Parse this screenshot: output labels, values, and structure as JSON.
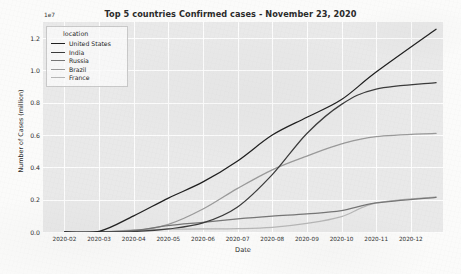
{
  "chart_data": {
    "type": "line",
    "title": "Top 5 countries Confirmed cases - November 23, 2020",
    "xlabel": "Date",
    "ylabel": "Number of Cases (million)",
    "y_exponent_label": "1e7",
    "grid": true,
    "legend_position": "upper left",
    "legend_title": "location",
    "x_tick_labels": [
      "2020-02",
      "2020-03",
      "2020-04",
      "2020-05",
      "2020-06",
      "2020-07",
      "2020-08",
      "2020-09",
      "2020-10",
      "2020-11",
      "2020-12"
    ],
    "y_tick_labels": [
      "0.0",
      "0.2",
      "0.4",
      "0.6",
      "0.8",
      "1.0",
      "1.2"
    ],
    "y_tick_values": [
      0.0,
      0.2,
      0.4,
      0.6,
      0.8,
      1.0,
      1.2
    ],
    "xlim": [
      "2020-01-22",
      "2020-12-05"
    ],
    "ylim": [
      0.0,
      1.3
    ],
    "y_units": "1e7 cases",
    "series": [
      {
        "name": "United States",
        "color": "#1f1f1f",
        "x": [
          "2020-02",
          "2020-03",
          "2020-04",
          "2020-05",
          "2020-06",
          "2020-07",
          "2020-08",
          "2020-09",
          "2020-10",
          "2020-11",
          "2020-11-23"
        ],
        "values": [
          0.0,
          0.004,
          0.1,
          0.21,
          0.31,
          0.44,
          0.6,
          0.71,
          0.82,
          0.99,
          1.255
        ]
      },
      {
        "name": "India",
        "color": "#3b3b3b",
        "x": [
          "2020-02",
          "2020-03",
          "2020-04",
          "2020-05",
          "2020-06",
          "2020-07",
          "2020-08",
          "2020-09",
          "2020-10",
          "2020-11",
          "2020-11-23"
        ],
        "values": [
          0.0,
          0.0001,
          0.003,
          0.019,
          0.056,
          0.155,
          0.355,
          0.61,
          0.79,
          0.885,
          0.925
        ]
      },
      {
        "name": "Russia",
        "color": "#767676",
        "x": [
          "2020-02",
          "2020-03",
          "2020-04",
          "2020-05",
          "2020-06",
          "2020-07",
          "2020-08",
          "2020-09",
          "2020-10",
          "2020-11",
          "2020-11-23"
        ],
        "values": [
          0.0,
          0.0002,
          0.01,
          0.04,
          0.06,
          0.081,
          0.098,
          0.112,
          0.132,
          0.18,
          0.215
        ]
      },
      {
        "name": "Brazil",
        "color": "#9a9a9a",
        "x": [
          "2020-02",
          "2020-03",
          "2020-04",
          "2020-05",
          "2020-06",
          "2020-07",
          "2020-08",
          "2020-09",
          "2020-10",
          "2020-11",
          "2020-11-23"
        ],
        "values": [
          0.0,
          0.0001,
          0.007,
          0.047,
          0.142,
          0.27,
          0.385,
          0.47,
          0.545,
          0.59,
          0.61
        ]
      },
      {
        "name": "France",
        "color": "#b6b6b6",
        "x": [
          "2020-02",
          "2020-03",
          "2020-04",
          "2020-05",
          "2020-06",
          "2020-07",
          "2020-08",
          "2020-09",
          "2020-10",
          "2020-11",
          "2020-11-23"
        ],
        "values": [
          0.0,
          0.0005,
          0.013,
          0.017,
          0.019,
          0.021,
          0.029,
          0.053,
          0.095,
          0.18,
          0.218
        ]
      }
    ]
  }
}
